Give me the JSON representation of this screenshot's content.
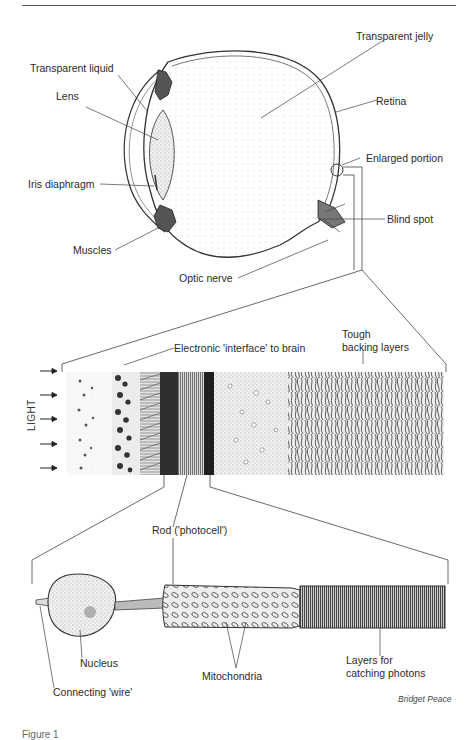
{
  "figure": {
    "caption": "Figure 1",
    "credit": "Bridget Peace"
  },
  "eye_diagram": {
    "labels": {
      "transparent_liquid": "Transparent liquid",
      "transparent_jelly": "Transparent jelly",
      "lens": "Lens",
      "retina": "Retina",
      "enlarged_portion": "Enlarged portion",
      "iris_diaphragm": "Iris diaphragm",
      "blind_spot": "Blind spot",
      "muscles": "Muscles",
      "optic_nerve": "Optic nerve"
    }
  },
  "retina_section": {
    "labels": {
      "interface": "Electronic 'interface' to brain",
      "tough_line1": "Tough",
      "tough_line2": "backing layers",
      "light": "LIGHT"
    },
    "light_arrows": 5
  },
  "rod_cell": {
    "labels": {
      "rod": "Rod ('photocell')",
      "nucleus": "Nucleus",
      "mitochondria": "Mitochondria",
      "layers_line1": "Layers for",
      "layers_line2": "catching photons",
      "connecting_wire": "Connecting 'wire'"
    }
  }
}
